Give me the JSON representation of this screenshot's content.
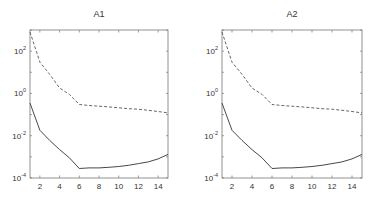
{
  "chart_data": [
    {
      "type": "line",
      "title": "A1",
      "xlabel": "",
      "ylabel": "",
      "yscale": "log",
      "xlim": [
        1,
        15
      ],
      "ylim": [
        0.0001,
        1000
      ],
      "xticks": [
        2,
        4,
        6,
        8,
        10,
        12,
        14
      ],
      "yticks": [
        {
          "value": 100,
          "label": "10^2"
        },
        {
          "value": 1,
          "label": "10^0"
        },
        {
          "value": 0.01,
          "label": "10^-2"
        },
        {
          "value": 0.0001,
          "label": "10^-4"
        }
      ],
      "grid": false,
      "legend": null,
      "x": [
        1,
        2,
        3,
        4,
        5,
        6,
        7,
        8,
        9,
        10,
        11,
        12,
        13,
        14,
        15
      ],
      "series": [
        {
          "name": "dashed",
          "style": "dashed",
          "color": "#555555",
          "values": [
            800,
            30,
            8,
            1.8,
            0.9,
            0.3,
            0.27,
            0.25,
            0.23,
            0.21,
            0.19,
            0.18,
            0.16,
            0.14,
            0.12
          ]
        },
        {
          "name": "solid",
          "style": "solid",
          "color": "#333333",
          "values": [
            0.35,
            0.018,
            0.006,
            0.0022,
            0.0009,
            0.00028,
            0.0003,
            0.0003,
            0.00032,
            0.00035,
            0.0004,
            0.00048,
            0.00058,
            0.0008,
            0.0013
          ]
        }
      ]
    },
    {
      "type": "line",
      "title": "A2",
      "xlabel": "",
      "ylabel": "",
      "yscale": "log",
      "xlim": [
        1,
        15
      ],
      "ylim": [
        0.0001,
        1000
      ],
      "xticks": [
        2,
        4,
        6,
        8,
        10,
        12,
        14
      ],
      "yticks": [
        {
          "value": 100,
          "label": "10^2"
        },
        {
          "value": 1,
          "label": "10^0"
        },
        {
          "value": 0.01,
          "label": "10^-2"
        },
        {
          "value": 0.0001,
          "label": "10^-4"
        }
      ],
      "grid": false,
      "legend": null,
      "x": [
        1,
        2,
        3,
        4,
        5,
        6,
        7,
        8,
        9,
        10,
        11,
        12,
        13,
        14,
        15
      ],
      "series": [
        {
          "name": "dashed",
          "style": "dashed",
          "color": "#555555",
          "values": [
            800,
            30,
            8,
            1.8,
            0.9,
            0.3,
            0.27,
            0.25,
            0.23,
            0.21,
            0.19,
            0.18,
            0.16,
            0.14,
            0.12
          ]
        },
        {
          "name": "solid",
          "style": "solid",
          "color": "#333333",
          "values": [
            0.35,
            0.018,
            0.006,
            0.0022,
            0.0009,
            0.00028,
            0.0003,
            0.0003,
            0.00032,
            0.00035,
            0.0004,
            0.00048,
            0.00058,
            0.0008,
            0.0013
          ]
        }
      ]
    }
  ],
  "layout": {
    "panels": [
      {
        "left": 30,
        "top": 30,
        "right": 168,
        "bottom": 178
      },
      {
        "left": 222,
        "top": 30,
        "right": 362,
        "bottom": 178
      }
    ]
  }
}
